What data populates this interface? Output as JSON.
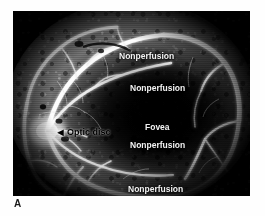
{
  "figure": {
    "panel_letter": "A",
    "modality": "fluorescein-angiogram",
    "frame": {
      "x": 13,
      "y": 11,
      "width": 237,
      "height": 185,
      "background_color": "#000000"
    },
    "page_background_color": "#ffffff"
  },
  "annotations": [
    {
      "id": "nonperfusion-superior",
      "text": "Nonperfusion",
      "color": "#f2f2f2",
      "style": "light",
      "font_size": 8.5,
      "x": 119,
      "y": 47,
      "has_arrow": false
    },
    {
      "id": "nonperfusion-midsuperior",
      "text": "Nonperfusion",
      "color": "#f2f2f2",
      "style": "light",
      "font_size": 8.5,
      "x": 130,
      "y": 79,
      "has_arrow": false
    },
    {
      "id": "fovea",
      "text": "Fovea",
      "color": "#f2f2f2",
      "style": "light",
      "font_size": 8.5,
      "x": 145,
      "y": 118,
      "has_arrow": false
    },
    {
      "id": "nonperfusion-fovea",
      "text": "Nonperfusion",
      "color": "#f2f2f2",
      "style": "light",
      "font_size": 8.5,
      "x": 130,
      "y": 136,
      "has_arrow": false
    },
    {
      "id": "nonperfusion-inferior",
      "text": "Nonperfusion",
      "color": "#f2f2f2",
      "style": "light",
      "font_size": 8.5,
      "x": 128,
      "y": 180,
      "has_arrow": false
    }
  ],
  "pointer_annotation": {
    "id": "optic-disc",
    "text": "Optic disc",
    "arrow_glyph": "◄",
    "arrow_direction": "left",
    "color": "#000000",
    "style": "dark",
    "font_size": 9,
    "x": 55,
    "y": 121
  },
  "anatomy_regions": [
    {
      "name": "optic-disc",
      "description": "bright hyperfluorescent disc, left-of-center"
    },
    {
      "name": "fovea",
      "description": "dark hypofluorescent central macula"
    },
    {
      "name": "retinal-vessels",
      "description": "bright white fluorescein-filled arcades"
    },
    {
      "name": "nonperfusion-zones",
      "description": "dark capillary dropout areas"
    }
  ]
}
